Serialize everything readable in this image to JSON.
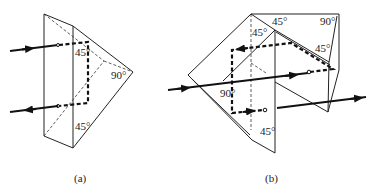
{
  "figure": {
    "panels": [
      {
        "id": "a",
        "caption": "(a)",
        "angles": [
          "45°",
          "90°",
          "45°"
        ]
      },
      {
        "id": "b",
        "caption": "(b)",
        "angles": [
          "45°",
          "90°",
          "45°",
          "45°",
          "90°",
          "45°"
        ]
      }
    ]
  }
}
